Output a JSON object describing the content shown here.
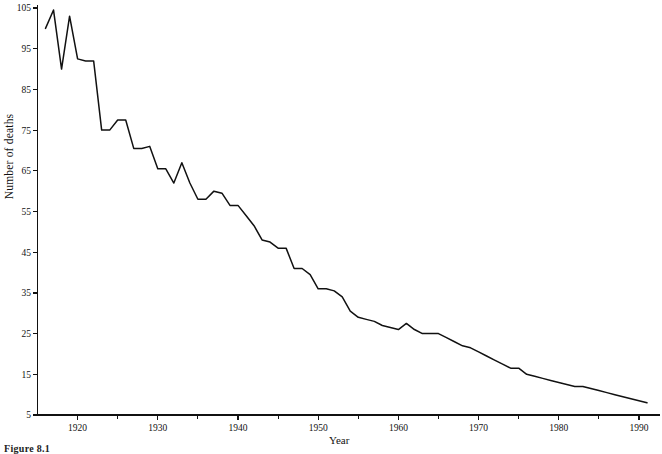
{
  "figure": {
    "caption": "Figure 8.1"
  },
  "chart_data": {
    "type": "line",
    "title": "",
    "xlabel": "Year",
    "ylabel": "Number of deaths",
    "xlim": [
      1915,
      1992
    ],
    "ylim": [
      5,
      105
    ],
    "grid": false,
    "legend": "none",
    "xticks": [
      1920,
      1930,
      1940,
      1950,
      1960,
      1970,
      1980,
      1990
    ],
    "xtick_labels": [
      "1920",
      "1930",
      "1940",
      "1950",
      "1960",
      "1970",
      "1980",
      "1990"
    ],
    "xminor_ticks": [
      1925,
      1935,
      1945,
      1955,
      1965,
      1975,
      1985
    ],
    "yticks": [
      5,
      15,
      25,
      35,
      45,
      55,
      65,
      75,
      85,
      95,
      105
    ],
    "ytick_labels": [
      "5",
      "15",
      "25",
      "35",
      "45",
      "55",
      "65",
      "75",
      "85",
      "95",
      "105"
    ],
    "line_color": "#111111",
    "x": [
      1916,
      1917,
      1918,
      1919,
      1920,
      1921,
      1922,
      1923,
      1924,
      1925,
      1926,
      1927,
      1928,
      1929,
      1930,
      1931,
      1932,
      1933,
      1934,
      1935,
      1936,
      1937,
      1938,
      1939,
      1940,
      1941,
      1942,
      1943,
      1944,
      1945,
      1946,
      1947,
      1948,
      1949,
      1950,
      1951,
      1952,
      1953,
      1954,
      1955,
      1956,
      1957,
      1958,
      1959,
      1960,
      1961,
      1962,
      1963,
      1964,
      1965,
      1966,
      1967,
      1968,
      1969,
      1970,
      1971,
      1972,
      1973,
      1974,
      1975,
      1976,
      1977,
      1978,
      1979,
      1980,
      1981,
      1982,
      1983,
      1984,
      1985,
      1986,
      1987,
      1988,
      1989,
      1990,
      1991
    ],
    "values": [
      100.0,
      104.5,
      90.0,
      103.0,
      92.5,
      92.0,
      92.0,
      75.0,
      75.0,
      77.5,
      77.5,
      70.5,
      70.5,
      71.0,
      65.5,
      65.5,
      62.0,
      67.0,
      62.0,
      58.0,
      58.0,
      60.0,
      59.5,
      56.5,
      56.5,
      54.0,
      51.5,
      48.0,
      47.5,
      46.0,
      46.0,
      41.0,
      41.0,
      39.5,
      36.0,
      36.0,
      35.5,
      34.0,
      30.5,
      29.0,
      28.5,
      28.0,
      27.0,
      26.5,
      26.0,
      27.5,
      26.0,
      25.0,
      25.0,
      25.0,
      24.0,
      23.0,
      22.0,
      21.5,
      20.5,
      19.5,
      18.5,
      17.5,
      16.5,
      16.5,
      15.0,
      14.5,
      14.0,
      13.5,
      13.0,
      12.5,
      12.0,
      12.0,
      11.5,
      11.0,
      10.5,
      10.0,
      9.5,
      9.0,
      8.5,
      8.0
    ]
  }
}
